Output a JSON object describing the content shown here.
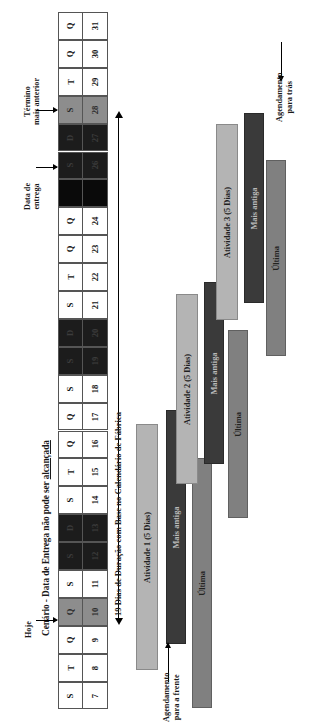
{
  "figure": {
    "title_prefix": "Cenário - Data de Entrega não pode ser ",
    "title_underlined": "alcançada",
    "orientation": "rotated-90",
    "duration_label": "19 Dias de Duração com Base no Calendário de Fábrica"
  },
  "annotations": {
    "today": "Hoje",
    "due_date": "Data de\nentrega",
    "due_date_line1": "Data de",
    "due_date_line2": "entrega",
    "earliest_finish_line1": "Término",
    "earliest_finish_line2": "mais anterior",
    "forward_scheduling_line1": "Agendamento",
    "forward_scheduling_line2": "para a frente",
    "backward_scheduling_line1": "Agendamento",
    "backward_scheduling_line2": "para trás"
  },
  "calendar": {
    "header_row_label": "dia-da-semana",
    "days": [
      {
        "dow": "S",
        "num": "7",
        "state": "workday"
      },
      {
        "dow": "T",
        "num": "8",
        "state": "workday"
      },
      {
        "dow": "Q",
        "num": "9",
        "state": "workday"
      },
      {
        "dow": "Q",
        "num": "10",
        "state": "today"
      },
      {
        "dow": "S",
        "num": "11",
        "state": "workday"
      },
      {
        "dow": "S",
        "num": "12",
        "state": "weekend"
      },
      {
        "dow": "D",
        "num": "13",
        "state": "weekend"
      },
      {
        "dow": "S",
        "num": "14",
        "state": "workday"
      },
      {
        "dow": "T",
        "num": "15",
        "state": "workday"
      },
      {
        "dow": "Q",
        "num": "16",
        "state": "workday"
      },
      {
        "dow": "Q",
        "num": "17",
        "state": "workday"
      },
      {
        "dow": "S",
        "num": "18",
        "state": "workday"
      },
      {
        "dow": "S",
        "num": "19",
        "state": "weekend"
      },
      {
        "dow": "D",
        "num": "20",
        "state": "weekend"
      },
      {
        "dow": "S",
        "num": "21",
        "state": "workday"
      },
      {
        "dow": "T",
        "num": "22",
        "state": "workday"
      },
      {
        "dow": "Q",
        "num": "23",
        "state": "workday"
      },
      {
        "dow": "Q",
        "num": "24",
        "state": "workday"
      },
      {
        "dow": "",
        "num": "25",
        "state": "duedate"
      },
      {
        "dow": "S",
        "num": "26",
        "state": "weekend"
      },
      {
        "dow": "D",
        "num": "27",
        "state": "weekend"
      },
      {
        "dow": "S",
        "num": "28",
        "state": "earliest-finish"
      },
      {
        "dow": "T",
        "num": "29",
        "state": "workday"
      },
      {
        "dow": "Q",
        "num": "30",
        "state": "workday"
      },
      {
        "dow": "Q",
        "num": "31",
        "state": "workday"
      }
    ]
  },
  "bars": [
    {
      "id": "atividade1",
      "label": "Atividade 1 (5 Dias)",
      "style": "light"
    },
    {
      "id": "atividade1-mais",
      "label": "Mais antiga",
      "style": "dark"
    },
    {
      "id": "atividade1-ultima",
      "label": "Última",
      "style": "mid"
    },
    {
      "id": "atividade2",
      "label": "Atividade 2 (5 Dias)",
      "style": "light"
    },
    {
      "id": "atividade2-mais",
      "label": "Mais antiga",
      "style": "dark"
    },
    {
      "id": "atividade2-ultima",
      "label": "Última",
      "style": "mid"
    },
    {
      "id": "atividade3",
      "label": "Atividade 3 (5 Dias)",
      "style": "light"
    },
    {
      "id": "atividade3-mais",
      "label": "Mais antiga",
      "style": "dark"
    },
    {
      "id": "atividade3-ultima",
      "label": "Última",
      "style": "mid"
    }
  ],
  "chart_data": {
    "type": "bar",
    "title": "Cenário - Data de Entrega não pode ser alcançada",
    "xlabel": "",
    "ylabel": "",
    "categories": [
      "Atividade 1 (5 Dias)",
      "Atividade 2 (5 Dias)",
      "Atividade 3 (5 Dias)"
    ],
    "series": [
      {
        "name": "Atividade (5 Dias)",
        "values": [
          5,
          5,
          5
        ]
      },
      {
        "name": "Mais antiga",
        "values": [
          5,
          5,
          5
        ]
      },
      {
        "name": "Última",
        "values": [
          5,
          5,
          5
        ]
      }
    ],
    "annotations": [
      "Hoje",
      "Data de entrega",
      "Término mais anterior",
      "19 Dias de Duração com Base no Calendário de Fábrica",
      "Agendamento para a frente",
      "Agendamento para trás"
    ],
    "legend_position": "none",
    "grid": false
  },
  "colors": {
    "bar_light": "#b4b4b4",
    "bar_dark": "#3a3a3a",
    "bar_mid": "#808080",
    "cell_today": "#8d8d8d",
    "cell_weekend": "#1c1c1c",
    "cell_duedate": "#0a0a0a",
    "background": "#ffffff",
    "ink": "#1a1a1a"
  }
}
